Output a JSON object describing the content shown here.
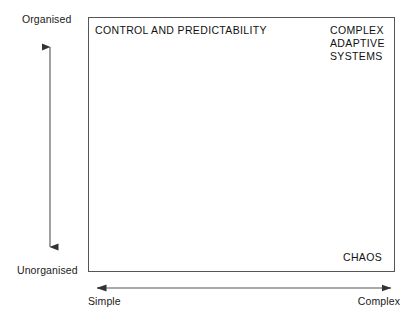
{
  "diagram": {
    "line_color": "#555555",
    "text_color": "#111111",
    "background": "#ffffff",
    "y_axis": {
      "top_label": "Organised",
      "bottom_label": "Unorganised",
      "arrowheads": "both"
    },
    "x_axis": {
      "left_label": "Simple",
      "right_label": "Complex",
      "arrowheads": "both"
    },
    "quadrants": [
      {
        "id": "control-and-predictability",
        "position": "top-left",
        "lines": [
          "CONTROL AND PREDICTABILITY"
        ]
      },
      {
        "id": "complex-adaptive-systems",
        "position": "top-right",
        "lines": [
          "COMPLEX",
          "ADAPTIVE",
          "SYSTEMS"
        ]
      },
      {
        "id": "chaos",
        "position": "bottom-right",
        "lines": [
          "CHAOS"
        ]
      }
    ]
  }
}
